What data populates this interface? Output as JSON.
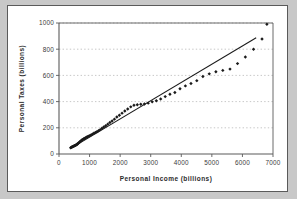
{
  "chart_data": {
    "type": "scatter",
    "title": "",
    "xlabel": "Personal Income (billions)",
    "ylabel": "Personal Taxes (billions)",
    "xlim": [
      0,
      7000
    ],
    "ylim": [
      0,
      1000
    ],
    "xticks": [
      0,
      1000,
      2000,
      3000,
      4000,
      5000,
      6000,
      7000
    ],
    "yticks": [
      0,
      200,
      400,
      600,
      800,
      1000
    ],
    "grid": "horizontal-dotted",
    "legend": "none",
    "marker": "diamond",
    "marker_color": "#1a1a1a",
    "line_color": "#1a1a1a",
    "gridline_color": "#b9b9b9",
    "axis_color": "#5a5a5a",
    "background_color": "#ffffff",
    "page_background_color": "#c8c8c8",
    "series": [
      {
        "name": "Personal Taxes vs Personal Income",
        "points": [
          [
            381,
            48
          ],
          [
            409,
            52
          ],
          [
            426,
            53
          ],
          [
            443,
            56
          ],
          [
            462,
            58
          ],
          [
            478,
            60
          ],
          [
            495,
            62
          ],
          [
            512,
            63
          ],
          [
            531,
            66
          ],
          [
            548,
            68
          ],
          [
            566,
            70
          ],
          [
            583,
            72
          ],
          [
            601,
            76
          ],
          [
            622,
            80
          ],
          [
            645,
            85
          ],
          [
            668,
            90
          ],
          [
            692,
            95
          ],
          [
            716,
            100
          ],
          [
            742,
            105
          ],
          [
            770,
            110
          ],
          [
            800,
            114
          ],
          [
            830,
            118
          ],
          [
            862,
            122
          ],
          [
            895,
            128
          ],
          [
            930,
            132
          ],
          [
            968,
            136
          ],
          [
            1008,
            140
          ],
          [
            1050,
            146
          ],
          [
            1096,
            152
          ],
          [
            1142,
            158
          ],
          [
            1190,
            164
          ],
          [
            1240,
            170
          ],
          [
            1293,
            178
          ],
          [
            1348,
            186
          ],
          [
            1406,
            196
          ],
          [
            1466,
            206
          ],
          [
            1529,
            216
          ],
          [
            1595,
            228
          ],
          [
            1664,
            240
          ],
          [
            1737,
            252
          ],
          [
            1813,
            266
          ],
          [
            1892,
            282
          ],
          [
            1975,
            296
          ],
          [
            2062,
            312
          ],
          [
            2153,
            328
          ],
          [
            2248,
            344
          ],
          [
            2348,
            360
          ],
          [
            2452,
            372
          ],
          [
            2561,
            376
          ],
          [
            2675,
            380
          ],
          [
            2794,
            382
          ],
          [
            2918,
            388
          ],
          [
            3048,
            398
          ],
          [
            3184,
            406
          ],
          [
            3326,
            420
          ],
          [
            3474,
            438
          ],
          [
            3629,
            456
          ],
          [
            3790,
            470
          ],
          [
            3958,
            498
          ],
          [
            4134,
            520
          ],
          [
            4317,
            538
          ],
          [
            4508,
            560
          ],
          [
            4707,
            592
          ],
          [
            4915,
            612
          ],
          [
            5132,
            628
          ],
          [
            5358,
            638
          ],
          [
            5594,
            648
          ],
          [
            5840,
            690
          ],
          [
            6096,
            740
          ],
          [
            6363,
            800
          ],
          [
            6641,
            878
          ],
          [
            6800,
            990
          ]
        ]
      }
    ],
    "trendline": {
      "type": "linear",
      "x_start": 400,
      "y_start": 45,
      "x_end": 6450,
      "y_end": 888
    }
  }
}
